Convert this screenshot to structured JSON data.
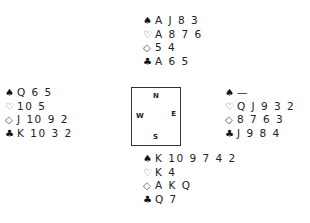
{
  "diagram": {
    "north": {
      "spades": "A J 8 3",
      "hearts": "A 8 7 6",
      "diamonds": "5 4",
      "clubs": "A 6 5"
    },
    "west": {
      "spades": "Q 6 5",
      "hearts": "10 5",
      "diamonds": "J 10 9 2",
      "clubs": "K 10 3 2"
    },
    "east": {
      "spades": "—",
      "hearts": "Q J 9 3 2",
      "diamonds": "8 7 6 3",
      "clubs": "J 9 8 4"
    },
    "south": {
      "spades": "K 10 9 7 4 2",
      "hearts": "K 4",
      "diamonds": "A K Q",
      "clubs": "Q 7"
    },
    "compass": {
      "n": "N",
      "s": "S",
      "w": "W",
      "e": "E"
    },
    "suit_symbols": {
      "spades": "♠",
      "hearts": "♡",
      "diamonds": "◇",
      "clubs": "♣"
    }
  }
}
